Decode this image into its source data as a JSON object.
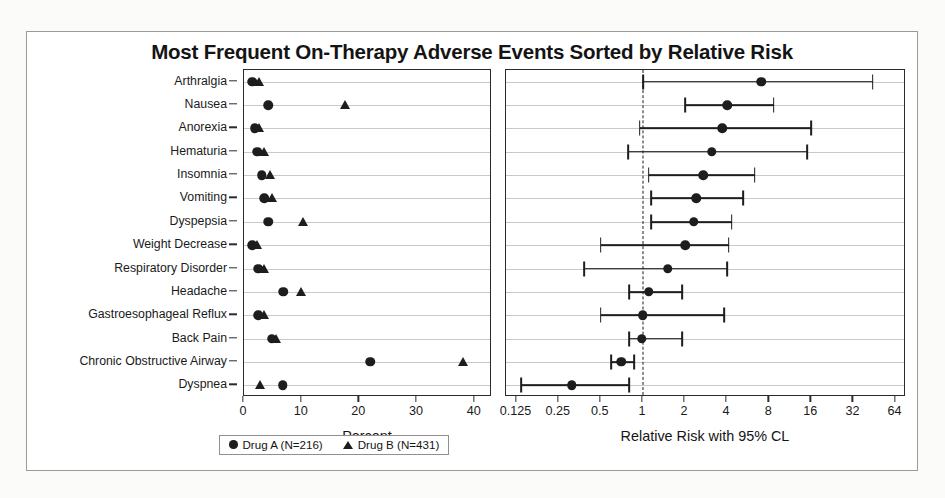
{
  "chart_data": {
    "type": "scatter",
    "title": "Most Frequent On-Therapy Adverse Events Sorted by Relative Risk",
    "categories": [
      "Arthralgia",
      "Nausea",
      "Anorexia",
      "Hematuria",
      "Insomnia",
      "Vomiting",
      "Dyspepsia",
      "Weight Decrease",
      "Respiratory Disorder",
      "Headache",
      "Gastroesophageal Reflux",
      "Back Pain",
      "Chronic Obstructive Airway",
      "Dyspnea"
    ],
    "panels": [
      {
        "id": "percent",
        "xlabel": "Percent",
        "xticks": [
          0,
          10,
          20,
          30,
          40
        ],
        "xlim": [
          0,
          43
        ],
        "scale": "linear",
        "grid": true,
        "series": [
          {
            "name": "Drug A (N=216)",
            "marker": "circle",
            "values": [
              1.4,
              4.2,
              1.9,
              2.3,
              3.1,
              3.5,
              4.2,
              1.4,
              2.5,
              6.8,
              2.5,
              4.8,
              21.9,
              6.7
            ]
          },
          {
            "name": "Drug B (N=431)",
            "marker": "triangle",
            "values": [
              2.6,
              17.5,
              2.6,
              3.4,
              4.5,
              4.9,
              10.2,
              2.3,
              3.4,
              9.9,
              3.5,
              5.6,
              38.0,
              2.7
            ]
          }
        ]
      },
      {
        "id": "relative-risk",
        "xlabel": "Relative Risk with 95% CL",
        "xticks": [
          0.125,
          0.25,
          0.5,
          1,
          2,
          4,
          8,
          16,
          32,
          64
        ],
        "xlim": [
          0.105,
          76
        ],
        "scale": "log2",
        "grid": true,
        "reference_line": 1,
        "marker": "circle",
        "points": [
          {
            "category": "Arthralgia",
            "rr": 7.0,
            "lcl": 1.0,
            "ucl": 44.0
          },
          {
            "category": "Nausea",
            "rr": 4.0,
            "lcl": 2.0,
            "ucl": 8.6
          },
          {
            "category": "Anorexia",
            "rr": 3.7,
            "lcl": 0.95,
            "ucl": 16.0
          },
          {
            "category": "Hematuria",
            "rr": 3.1,
            "lcl": 0.78,
            "ucl": 15.0
          },
          {
            "category": "Insomnia",
            "rr": 2.7,
            "lcl": 1.1,
            "ucl": 6.3
          },
          {
            "category": "Vomiting",
            "rr": 2.4,
            "lcl": 1.15,
            "ucl": 5.2
          },
          {
            "category": "Dyspepsia",
            "rr": 2.3,
            "lcl": 1.15,
            "ucl": 4.3
          },
          {
            "category": "Weight Decrease",
            "rr": 2.0,
            "lcl": 0.5,
            "ucl": 4.1
          },
          {
            "category": "Respiratory Disorder",
            "rr": 1.5,
            "lcl": 0.38,
            "ucl": 4.0
          },
          {
            "category": "Headache",
            "rr": 1.1,
            "lcl": 0.8,
            "ucl": 1.9
          },
          {
            "category": "Gastroesophageal Reflux",
            "rr": 1.0,
            "lcl": 0.5,
            "ucl": 3.8
          },
          {
            "category": "Back Pain",
            "rr": 0.98,
            "lcl": 0.8,
            "ucl": 1.9
          },
          {
            "category": "Chronic Obstructive Airway",
            "rr": 0.7,
            "lcl": 0.59,
            "ucl": 0.87
          },
          {
            "category": "Dyspnea",
            "rr": 0.31,
            "lcl": 0.135,
            "ucl": 0.8
          }
        ]
      }
    ],
    "legend": {
      "position": "bottom-left",
      "entries": [
        {
          "marker": "circle",
          "label": "Drug A (N=216)"
        },
        {
          "marker": "triangle",
          "label": "Drug B (N=431)"
        }
      ]
    }
  },
  "colors": {
    "marker": "#1d1d1d",
    "grid": "#c9c9c9",
    "axis": "#2b2b2b",
    "background": "#ffffff"
  }
}
